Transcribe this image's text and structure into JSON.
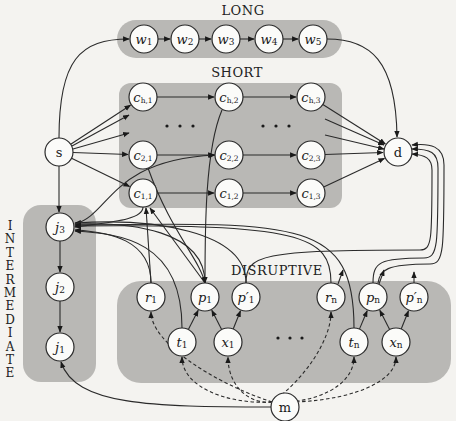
{
  "groups": {
    "long": "LONG",
    "short": "SHORT",
    "disruptive": "DISRUPTIVE",
    "intermediate": "INTERMEDIATE"
  },
  "nodes": {
    "w1": {
      "main": "w",
      "sub": "1"
    },
    "w2": {
      "main": "w",
      "sub": "2"
    },
    "w3": {
      "main": "w",
      "sub": "3"
    },
    "w4": {
      "main": "w",
      "sub": "4"
    },
    "w5": {
      "main": "w",
      "sub": "5"
    },
    "ch1": {
      "main": "c",
      "sub": "h,1"
    },
    "ch2": {
      "main": "c",
      "sub": "h,2"
    },
    "ch3": {
      "main": "c",
      "sub": "h,3"
    },
    "c21": {
      "main": "c",
      "sub": "2,1"
    },
    "c22": {
      "main": "c",
      "sub": "2,2"
    },
    "c23": {
      "main": "c",
      "sub": "2,3"
    },
    "c11": {
      "main": "c",
      "sub": "1,1"
    },
    "c12": {
      "main": "c",
      "sub": "1,2"
    },
    "c13": {
      "main": "c",
      "sub": "1,3"
    },
    "s": {
      "main": "s",
      "sub": ""
    },
    "d": {
      "main": "d",
      "sub": ""
    },
    "m": {
      "main": "m",
      "sub": ""
    },
    "j3": {
      "main": "j",
      "sub": "3"
    },
    "j2": {
      "main": "j",
      "sub": "2"
    },
    "j1": {
      "main": "j",
      "sub": "1"
    },
    "r1": {
      "main": "r",
      "sub": "1"
    },
    "p1": {
      "main": "p",
      "sub": "1"
    },
    "pp1": {
      "main": "p′",
      "sub": "1"
    },
    "t1": {
      "main": "t",
      "sub": "1"
    },
    "x1": {
      "main": "x",
      "sub": "1"
    },
    "rn": {
      "main": "r",
      "sub": "n"
    },
    "pn": {
      "main": "p",
      "sub": "n"
    },
    "ppn": {
      "main": "p′",
      "sub": "n"
    },
    "tn": {
      "main": "t",
      "sub": "n"
    },
    "xn": {
      "main": "x",
      "sub": "n"
    }
  },
  "ellipsis": "· · ·"
}
